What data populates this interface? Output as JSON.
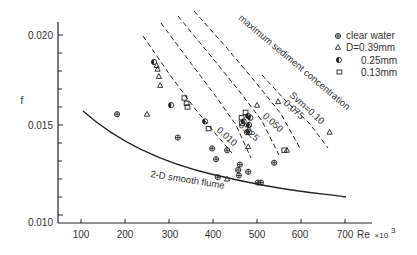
{
  "chart_data": {
    "type": "scatter",
    "title": "",
    "xlabel": "Re",
    "xlabel_suffix": "×10",
    "xlabel_exponent": "3",
    "ylabel": "f",
    "xlim": [
      52,
      750
    ],
    "ylim": [
      0.01,
      0.0205
    ],
    "x_ticks": [
      100,
      200,
      300,
      400,
      500,
      600,
      700
    ],
    "y_tick_labels": [
      {
        "value": 0.02,
        "label": "0.020"
      },
      {
        "value": 0.015,
        "label": "0.015"
      },
      {
        "value": 0.01,
        "label": "0.010"
      }
    ],
    "y_minor_ticks": [
      0.011,
      0.012,
      0.013,
      0.014,
      0.016,
      0.017,
      0.018,
      0.019
    ],
    "grid": false,
    "legend_position": "upper right",
    "legend": [
      {
        "marker": "circle-plus",
        "label": "clear water"
      },
      {
        "marker": "triangle",
        "label": "D=0.39mm"
      },
      {
        "marker": "circle-half",
        "label": "0.25mm"
      },
      {
        "marker": "square",
        "label": "0.13mm"
      }
    ],
    "series": [
      {
        "name": "clear water",
        "marker": "circle-plus",
        "points": [
          [
            182,
            0.0156
          ],
          [
            320,
            0.0143
          ],
          [
            398,
            0.0137
          ],
          [
            407,
            0.0131
          ],
          [
            411,
            0.0121
          ],
          [
            432,
            0.0136
          ],
          [
            457,
            0.0125
          ],
          [
            459,
            0.0122
          ],
          [
            461,
            0.0128
          ],
          [
            477,
            0.0146
          ],
          [
            480,
            0.0124
          ],
          [
            502,
            0.0118
          ],
          [
            509,
            0.0118
          ],
          [
            539,
            0.0129
          ]
        ]
      },
      {
        "name": "D=0.39mm",
        "marker": "triangle",
        "points": [
          [
            272,
            0.0183
          ],
          [
            274,
            0.0181
          ],
          [
            277,
            0.0177
          ],
          [
            280,
            0.0172
          ],
          [
            250,
            0.0156
          ],
          [
            432,
            0.012
          ],
          [
            480,
            0.0138
          ],
          [
            480,
            0.015
          ],
          [
            500,
            0.0161
          ],
          [
            568,
            0.0136
          ],
          [
            548,
            0.0163
          ],
          [
            665,
            0.0146
          ]
        ]
      },
      {
        "name": "0.25mm",
        "marker": "circle-half",
        "points": [
          [
            266,
            0.0185
          ],
          [
            305,
            0.0161
          ],
          [
            382,
            0.0152
          ],
          [
            470,
            0.0152
          ],
          [
            480,
            0.0155
          ],
          [
            482,
            0.015
          ],
          [
            482,
            0.0146
          ],
          [
            485,
            0.0154
          ]
        ]
      },
      {
        "name": "0.13mm",
        "marker": "square",
        "points": [
          [
            335,
            0.0165
          ],
          [
            340,
            0.0162
          ],
          [
            342,
            0.016
          ],
          [
            390,
            0.0148
          ],
          [
            465,
            0.0154
          ],
          [
            466,
            0.0151
          ],
          [
            474,
            0.0157
          ],
          [
            562,
            0.0136
          ]
        ]
      }
    ],
    "curves": [
      {
        "name": "2-D smooth flume",
        "style": "solid",
        "label": "2-D smooth flume",
        "points": [
          [
            105,
            0.0157
          ],
          [
            150,
            0.0148
          ],
          [
            200,
            0.014
          ],
          [
            250,
            0.0134
          ],
          [
            300,
            0.0129
          ],
          [
            400,
            0.0122
          ],
          [
            500,
            0.0117
          ],
          [
            600,
            0.0113
          ],
          [
            700,
            0.011
          ]
        ]
      }
    ],
    "iso_lines": [
      {
        "label": "0.010",
        "style": "dashed",
        "px": [
          [
            143,
            36
          ],
          [
            170,
            75
          ],
          [
            196,
            110
          ],
          [
            214,
            132
          ],
          [
            232,
            153
          ]
        ]
      },
      {
        "label": "0.025",
        "style": "dashed",
        "px": [
          [
            161,
            23
          ],
          [
            190,
            62
          ],
          [
            217,
            98
          ],
          [
            236,
            125
          ],
          [
            251,
            158
          ]
        ]
      },
      {
        "label": "0.050",
        "style": "dashed",
        "px": [
          [
            178,
            16
          ],
          [
            210,
            55
          ],
          [
            240,
            92
          ],
          [
            262,
            121
          ],
          [
            279,
            155
          ]
        ]
      },
      {
        "label": "0.075",
        "style": "dashed",
        "px": [
          [
            194,
            11
          ],
          [
            226,
            47
          ],
          [
            257,
            84
          ],
          [
            281,
            114
          ],
          [
            301,
            150
          ]
        ]
      },
      {
        "label": "Svm=0.10",
        "style": "dashed",
        "px": [
          [
            262,
            75
          ],
          [
            285,
            100
          ],
          [
            310,
            124
          ],
          [
            328,
            148
          ]
        ]
      }
    ],
    "annotations": [
      {
        "text": "maximum sediment concentration",
        "rotation": 40
      },
      {
        "text": "2-D smooth flume",
        "rotation": 10
      },
      {
        "text": "0.010",
        "rotation": 40
      },
      {
        "text": "0.025",
        "rotation": 40
      },
      {
        "text": "0.050",
        "rotation": 40
      },
      {
        "text": "0.075",
        "rotation": 40
      },
      {
        "text": "Svm=0.10",
        "rotation": 40
      }
    ]
  },
  "labels": {
    "y_axis": "f",
    "x_axis": "Re",
    "x_suffix": "×10",
    "x_exp": "3",
    "curve": "2-D smooth flume",
    "max_conc": "maximum sediment concentration",
    "iso_010": "0.010",
    "iso_025": "0.025",
    "iso_050": "0.050",
    "iso_075": "0.075",
    "iso_10": "Svm=0.10",
    "legend_0": "clear water",
    "legend_1": "D=0.39mm",
    "legend_2": "0.25mm",
    "legend_3": "0.13mm",
    "ytick_020": "0.020",
    "ytick_015": "0.015",
    "ytick_010": "0.010",
    "xtick_100": "100",
    "xtick_200": "200",
    "xtick_300": "300",
    "xtick_400": "400",
    "xtick_500": "500",
    "xtick_600": "600",
    "xtick_700": "700"
  }
}
